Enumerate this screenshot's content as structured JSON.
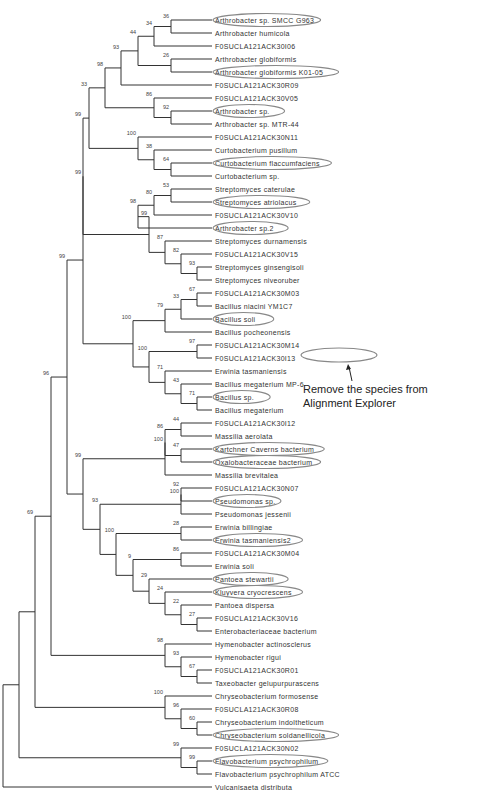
{
  "figure": {
    "type": "phylogenetic-tree",
    "annotation_line1": "Remove the species from",
    "annotation_line2": "Alignment Explorer",
    "line_color": "#333333",
    "highlight_color": "#888888"
  },
  "taxa": [
    {
      "label": "Arthrobacter sp. SMCC G963",
      "circled": true
    },
    {
      "label": "Arthrobacter humicola",
      "circled": false
    },
    {
      "label": "F0SUCLA121ACK30I06",
      "circled": false
    },
    {
      "label": "Arthrobacter globiformis",
      "circled": false
    },
    {
      "label": "Arthrobacter globiformis K01-05",
      "circled": true
    },
    {
      "label": "F0SUCLA121ACK30R09",
      "circled": false
    },
    {
      "label": "F0SUCLA121ACK30V05",
      "circled": false
    },
    {
      "label": "Arthrobacter sp.",
      "circled": true
    },
    {
      "label": "Arthrobacter sp. MTR-44",
      "circled": false
    },
    {
      "label": "F0SUCLA121ACK30N11",
      "circled": false
    },
    {
      "label": "Curtobacterium pusillum",
      "circled": false
    },
    {
      "label": "Curtobacterium flaccumfaciens",
      "circled": true
    },
    {
      "label": "Curtobacterium sp.",
      "circled": false
    },
    {
      "label": "Streptomyces caterulae",
      "circled": false
    },
    {
      "label": "Streptomyces atriolacus",
      "circled": true
    },
    {
      "label": "F0SUCLA121ACK30V10",
      "circled": false
    },
    {
      "label": "Arthrobacter sp.2",
      "circled": true
    },
    {
      "label": "Streptomyces durnamensis",
      "circled": false
    },
    {
      "label": "F0SUCLA121ACK30V15",
      "circled": false
    },
    {
      "label": "Streptomyces ginsengisoli",
      "circled": false
    },
    {
      "label": "Streptomyces niveoruber",
      "circled": false
    },
    {
      "label": "F0SUCLA121ACK30M03",
      "circled": false
    },
    {
      "label": "Bacillus niacini YM1C7",
      "circled": false
    },
    {
      "label": "Bacillus soli",
      "circled": true
    },
    {
      "label": "Bacillus pocheonensis",
      "circled": false
    },
    {
      "label": "F0SUCLA121ACK30M14",
      "circled": false
    },
    {
      "label": "F0SUCLA121ACK30I13",
      "circled": false
    },
    {
      "label": "Erwinia tasmaniensis",
      "circled": false
    },
    {
      "label": "Bacillus megaterium MP-6",
      "circled": false
    },
    {
      "label": "Bacillus sp.",
      "circled": true
    },
    {
      "label": "Bacillus megaterium",
      "circled": false
    },
    {
      "label": "F0SUCLA121ACK30I12",
      "circled": false
    },
    {
      "label": "Massilia aerolata",
      "circled": false
    },
    {
      "label": "Kartchner Caverns bacterium",
      "circled": true
    },
    {
      "label": "Oxalobacteraceae bacterium",
      "circled": true
    },
    {
      "label": "Massilia brevitalea",
      "circled": false
    },
    {
      "label": "F0SUCLA121ACK30N07",
      "circled": false
    },
    {
      "label": "Pseudomonas sp.",
      "circled": true
    },
    {
      "label": "Pseudomonas jessenii",
      "circled": false
    },
    {
      "label": "Erwinia billingiae",
      "circled": false
    },
    {
      "label": "Erwinia tasmaniensis2",
      "circled": true
    },
    {
      "label": "F0SUCLA121ACK30M04",
      "circled": false
    },
    {
      "label": "Erwinia soli",
      "circled": false
    },
    {
      "label": "Pantoea stewartii",
      "circled": true
    },
    {
      "label": "Kluyvera cryocrescens",
      "circled": true
    },
    {
      "label": "Pantoea dispersa",
      "circled": false
    },
    {
      "label": "F0SUCLA121ACK30V16",
      "circled": false
    },
    {
      "label": "Enterobacteriaceae bacterium",
      "circled": false
    },
    {
      "label": "Hymenobacter actinosclerus",
      "circled": false
    },
    {
      "label": "Hymenobacter rigui",
      "circled": false
    },
    {
      "label": "F0SUCLA121ACK30R01",
      "circled": false
    },
    {
      "label": "Taxeobacter gelupurpurascens",
      "circled": false
    },
    {
      "label": "Chryseobacterium formosense",
      "circled": false
    },
    {
      "label": "F0SUCLA121ACK30R08",
      "circled": false
    },
    {
      "label": "Chryseobacterium indoltheticum",
      "circled": false
    },
    {
      "label": "Chryseobacterium soldanellicola",
      "circled": true
    },
    {
      "label": "F0SUCLA121ACK30N02",
      "circled": false
    },
    {
      "label": "Flavobacterium psychrophilum",
      "circled": true
    },
    {
      "label": "Flavobacterium psychrophilum ATCC",
      "circled": false
    },
    {
      "label": "Vulcanisaeta distributa",
      "circled": false
    }
  ],
  "nodes": [
    {
      "id": "n1",
      "x": 171,
      "children": [
        0,
        1
      ],
      "boot": "36"
    },
    {
      "id": "n2",
      "x": 154,
      "children": [
        "n1",
        2
      ],
      "boot": "34"
    },
    {
      "id": "n3",
      "x": 171,
      "children": [
        3,
        4
      ],
      "boot": "26"
    },
    {
      "id": "n4",
      "x": 138,
      "children": [
        "n2",
        "n3"
      ],
      "boot": "44"
    },
    {
      "id": "n5",
      "x": 121,
      "children": [
        "n4",
        5
      ],
      "boot": "93"
    },
    {
      "id": "n6",
      "x": 171,
      "children": [
        7,
        8
      ],
      "boot": "92"
    },
    {
      "id": "n7",
      "x": 154,
      "children": [
        6,
        "n6"
      ],
      "boot": "86"
    },
    {
      "id": "n8",
      "x": 105,
      "children": [
        "n5",
        "n7"
      ],
      "boot": "98"
    },
    {
      "id": "n9",
      "x": 171,
      "children": [
        11,
        12
      ],
      "boot": "64"
    },
    {
      "id": "n10",
      "x": 154,
      "children": [
        10,
        "n9"
      ],
      "boot": "38"
    },
    {
      "id": "n11",
      "x": 138,
      "children": [
        9,
        "n10"
      ],
      "boot": "100"
    },
    {
      "id": "n12",
      "x": 89,
      "children": [
        "n8",
        "n11"
      ],
      "boot": "33"
    },
    {
      "id": "n13",
      "x": 171,
      "children": [
        13,
        14
      ],
      "boot": "53"
    },
    {
      "id": "n14",
      "x": 154,
      "children": [
        "n13",
        15
      ],
      "boot": "80"
    },
    {
      "id": "n15",
      "x": 138,
      "children": [
        "n14",
        16
      ],
      "boot": "98"
    },
    {
      "id": "n16",
      "x": 197,
      "children": [
        19,
        20
      ],
      "boot": "93"
    },
    {
      "id": "n17",
      "x": 181,
      "children": [
        18,
        "n16"
      ],
      "boot": "82"
    },
    {
      "id": "n18",
      "x": 165,
      "children": [
        17,
        "n17"
      ],
      "boot": "87"
    },
    {
      "id": "n19",
      "x": 149,
      "children": [
        "n15",
        "n18"
      ],
      "boot": "99"
    },
    {
      "id": "n20",
      "x": 83,
      "children": [
        "n12",
        "n19"
      ],
      "boot": "99"
    },
    {
      "id": "n21",
      "x": 197,
      "children": [
        21,
        22
      ],
      "boot": "67"
    },
    {
      "id": "n22",
      "x": 181,
      "children": [
        "n21",
        23
      ],
      "boot": "33"
    },
    {
      "id": "n23",
      "x": 165,
      "children": [
        "n22",
        24
      ],
      "boot": "79"
    },
    {
      "id": "n24",
      "x": 197,
      "children": [
        25,
        26
      ],
      "boot": "97"
    },
    {
      "id": "n25",
      "x": 197,
      "children": [
        29,
        30
      ],
      "boot": "71"
    },
    {
      "id": "n26",
      "x": 181,
      "children": [
        28,
        "n25"
      ],
      "boot": "43"
    },
    {
      "id": "n27",
      "x": 165,
      "children": [
        27,
        "n26"
      ],
      "boot": "71"
    },
    {
      "id": "n28",
      "x": 149,
      "children": [
        "n24",
        "n27"
      ],
      "boot": "100"
    },
    {
      "id": "n29",
      "x": 133,
      "children": [
        "n23",
        "n28"
      ],
      "boot": "100"
    },
    {
      "id": "n30",
      "x": 83,
      "children": [
        "n20",
        "n29"
      ],
      "boot": "99"
    },
    {
      "id": "n31",
      "x": 181,
      "children": [
        31,
        32
      ],
      "boot": "44"
    },
    {
      "id": "n32",
      "x": 181,
      "children": [
        33,
        34
      ],
      "boot": "47"
    },
    {
      "id": "n33",
      "x": 165,
      "children": [
        "n31",
        "n32"
      ],
      "boot": "86"
    },
    {
      "id": "n34",
      "x": 165,
      "children": [
        "n33",
        35
      ],
      "boot": "100"
    },
    {
      "id": "n35",
      "x": 181,
      "children": [
        36,
        37
      ],
      "boot": "92"
    },
    {
      "id": "n36",
      "x": 181,
      "children": [
        "n35",
        38
      ],
      "boot": "100"
    },
    {
      "id": "n37",
      "x": 181,
      "children": [
        39,
        40
      ],
      "boot": "28"
    },
    {
      "id": "n38",
      "x": 181,
      "children": [
        41,
        42
      ],
      "boot": "86"
    },
    {
      "id": "n39",
      "x": 197,
      "children": [
        46,
        47
      ],
      "boot": "27"
    },
    {
      "id": "n40",
      "x": 181,
      "children": [
        45,
        "n39"
      ],
      "boot": "22"
    },
    {
      "id": "n41",
      "x": 165,
      "children": [
        44,
        "n40"
      ],
      "boot": "24"
    },
    {
      "id": "n42",
      "x": 149,
      "children": [
        43,
        "n41"
      ],
      "boot": "29"
    },
    {
      "id": "n43",
      "x": 133,
      "children": [
        "n38",
        "n42"
      ],
      "boot": "9"
    },
    {
      "id": "n44",
      "x": 116,
      "children": [
        "n37",
        "n43"
      ],
      "boot": "100"
    },
    {
      "id": "n45",
      "x": 100,
      "children": [
        "n36",
        "n44"
      ],
      "boot": "93"
    },
    {
      "id": "n46",
      "x": 83,
      "children": [
        "n34",
        "n45"
      ],
      "boot": "99"
    },
    {
      "id": "n47",
      "x": 67,
      "children": [
        "n30",
        "n46"
      ],
      "boot": "99"
    },
    {
      "id": "n48",
      "x": 197,
      "children": [
        50,
        51
      ],
      "boot": "67"
    },
    {
      "id": "n49",
      "x": 181,
      "children": [
        49,
        "n48"
      ],
      "boot": "93"
    },
    {
      "id": "n50",
      "x": 165,
      "children": [
        48,
        "n49"
      ],
      "boot": "98"
    },
    {
      "id": "n51",
      "x": 51,
      "children": [
        "n47",
        "n50"
      ],
      "boot": "96"
    },
    {
      "id": "n52",
      "x": 197,
      "children": [
        54,
        55
      ],
      "boot": "60"
    },
    {
      "id": "n53",
      "x": 181,
      "children": [
        53,
        "n52"
      ],
      "boot": "96"
    },
    {
      "id": "n54",
      "x": 165,
      "children": [
        52,
        "n53"
      ],
      "boot": "100"
    },
    {
      "id": "n55",
      "x": 35,
      "children": [
        "n51",
        "n54"
      ],
      "boot": "69"
    },
    {
      "id": "n56",
      "x": 197,
      "children": [
        57,
        58
      ],
      "boot": "99"
    },
    {
      "id": "n57",
      "x": 181,
      "children": [
        56,
        "n56"
      ],
      "boot": "99"
    },
    {
      "id": "n58",
      "x": 19,
      "children": [
        "n55",
        "n57"
      ],
      "boot": ""
    },
    {
      "id": "root",
      "x": 3,
      "children": [
        "n58",
        59
      ],
      "boot": ""
    }
  ]
}
